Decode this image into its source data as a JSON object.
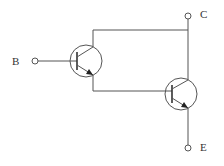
{
  "diagram": {
    "type": "darlington-pair-npn",
    "terminals": {
      "base": {
        "label": "B"
      },
      "collector": {
        "label": "C"
      },
      "emitter": {
        "label": "E"
      }
    },
    "transistors": [
      {
        "name": "Q1",
        "type": "NPN"
      },
      {
        "name": "Q2",
        "type": "NPN"
      }
    ],
    "colors": {
      "line": "#555555",
      "background": "#ffffff"
    }
  }
}
